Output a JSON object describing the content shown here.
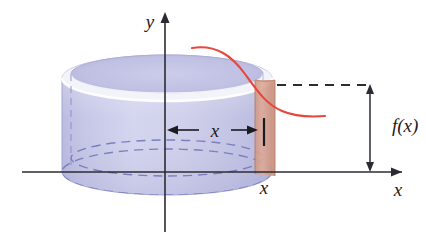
{
  "figure": {
    "kind": "math-diagram"
  },
  "axes": {
    "y_axis_label": "y",
    "x_axis_label": "x",
    "x_tick_label": "x",
    "axis_color": "#2b2b33"
  },
  "labels": {
    "radius_label": "x",
    "height_label": "f(x)"
  },
  "colors": {
    "cylinder_body": "#c6c6e6",
    "cylinder_body_dark": "#b3b4dd",
    "cylinder_rim_light": "#f2f2fa",
    "cylinder_outline": "#9a9ccd",
    "dashed_ellipse": "#7b7fbe",
    "shell_fill": "#d9a08f",
    "shell_edge": "#b57d6c",
    "curve": "#e8453c",
    "axis": "#2b2b33",
    "background": "#ffffff"
  },
  "geometry": {
    "y_axis_x": 165,
    "x_axis_y": 172,
    "cylinder_left": 62,
    "cylinder_right": 272,
    "cylinder_top_y": 78,
    "ellipse_rx": 105,
    "ellipse_ry": 23,
    "shell_left": 255,
    "shell_right": 275,
    "curve_start": [
      192,
      48
    ],
    "curve_end": [
      325,
      116
    ],
    "dashed_level_y": 85,
    "fx_arrow_x": 370
  }
}
